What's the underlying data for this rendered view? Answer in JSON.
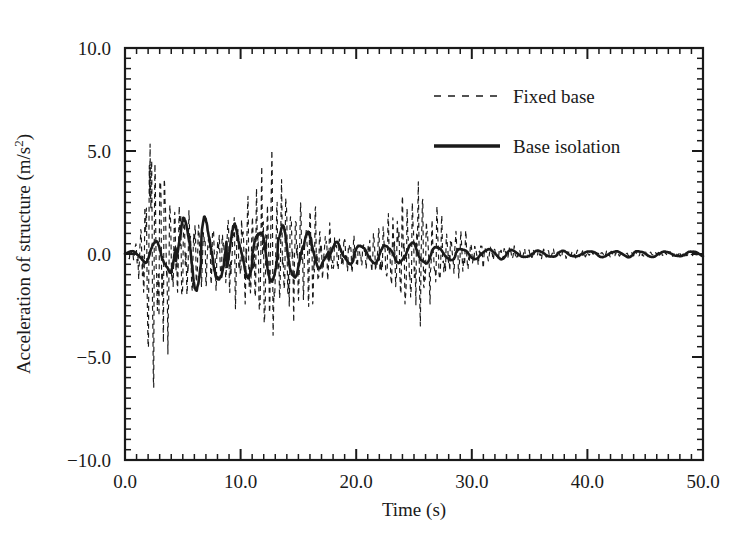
{
  "chart_data": {
    "type": "line",
    "title": "",
    "subtitle": "",
    "xlabel": "Time (s)",
    "ylabel": "Acceleration of structure (m/s²)",
    "xlim": [
      0.0,
      50.0
    ],
    "ylim": [
      -10.0,
      10.0
    ],
    "x_ticks": [
      0.0,
      10.0,
      20.0,
      30.0,
      40.0,
      50.0
    ],
    "x_tick_labels": [
      "0.0",
      "10.0",
      "20.0",
      "30.0",
      "40.0",
      "50.0"
    ],
    "x_minor_step": 1.0,
    "y_ticks": [
      -10.0,
      -5.0,
      0.0,
      5.0,
      10.0
    ],
    "y_tick_labels": [
      "−10.0",
      "−5.0",
      "0.0",
      "5.0",
      "10.0"
    ],
    "y_minor_step": 0.5,
    "grid": false,
    "frame": "box",
    "tick_direction": "in",
    "ticks_all_sides": true,
    "legend_position": "upper right",
    "legend_entries": [
      {
        "name": "Fixed base",
        "style": "dashed"
      },
      {
        "name": "Base isolation",
        "style": "solid"
      }
    ],
    "series": [
      {
        "name": "Fixed base",
        "style": "dashed",
        "description": "High-frequency response of fixed-base structure; large amplitude burst near t=2-4 s reaching +8.0 and -7.2, a second burst near t=11-16 s reaching about +5.0 and -4.5, a smaller burst near t=25-28 s reaching about +4.0, decaying to near zero after t=33 s.",
        "carrier_period_s": 0.42,
        "peak_positive": 8.0,
        "peak_negative": -7.2,
        "envelope_t": [
          0.0,
          1.0,
          1.8,
          2.2,
          2.6,
          3.2,
          4.0,
          5.0,
          6.0,
          7.0,
          8.0,
          9.0,
          10.0,
          11.0,
          11.8,
          12.4,
          13.0,
          14.0,
          15.0,
          16.0,
          17.0,
          18.0,
          19.0,
          20.0,
          21.0,
          22.0,
          23.0,
          24.0,
          25.0,
          26.0,
          27.0,
          28.0,
          29.0,
          30.0,
          31.0,
          32.0,
          33.0,
          35.0,
          38.0,
          41.0,
          44.0,
          47.0,
          50.0
        ],
        "envelope_a": [
          0.05,
          0.6,
          4.2,
          8.0,
          6.0,
          4.6,
          3.8,
          2.6,
          2.2,
          1.9,
          1.8,
          2.0,
          2.4,
          3.2,
          4.4,
          5.0,
          4.6,
          3.8,
          3.2,
          2.6,
          1.9,
          1.3,
          1.0,
          0.9,
          0.9,
          1.2,
          1.8,
          2.6,
          3.6,
          3.2,
          2.4,
          1.6,
          1.1,
          0.8,
          0.6,
          0.45,
          0.35,
          0.25,
          0.2,
          0.16,
          0.14,
          0.12,
          0.1
        ]
      },
      {
        "name": "Base isolation",
        "style": "solid",
        "description": "Smooth low-frequency response of base-isolated structure; dominant period about 2.2 s, peak amplitude about +2.0 near t=7 s and -2.0 near t=5 s, gradually decaying to about ±0.2 after t=32 s.",
        "carrier_period_s": 2.2,
        "peak_positive": 2.0,
        "peak_negative": -2.1,
        "envelope_t": [
          0.0,
          1.0,
          2.0,
          2.6,
          3.4,
          4.2,
          5.0,
          6.0,
          7.0,
          8.0,
          9.0,
          10.0,
          11.0,
          12.0,
          13.0,
          14.0,
          15.0,
          16.0,
          17.0,
          18.0,
          19.0,
          20.0,
          22.0,
          24.0,
          25.0,
          26.0,
          27.0,
          28.0,
          30.0,
          32.0,
          34.0,
          37.0,
          40.0,
          44.0,
          47.0,
          50.0
        ],
        "envelope_a": [
          0.05,
          0.25,
          0.55,
          0.75,
          0.95,
          1.55,
          2.05,
          1.7,
          2.0,
          1.65,
          1.55,
          1.5,
          1.2,
          1.5,
          1.45,
          1.25,
          1.3,
          1.1,
          0.75,
          0.6,
          0.55,
          0.55,
          0.55,
          0.5,
          0.6,
          0.55,
          0.45,
          0.38,
          0.3,
          0.25,
          0.2,
          0.18,
          0.17,
          0.16,
          0.15,
          0.15
        ]
      }
    ]
  },
  "axes": {
    "x_title": "Time (s)",
    "y_title": "Acceleration of structure (m/s²)"
  },
  "legend": {
    "fixed_base_label": "Fixed base",
    "base_isolation_label": "Base isolation"
  },
  "colors": {
    "ink": "#1a1a1a",
    "background": "#ffffff"
  }
}
